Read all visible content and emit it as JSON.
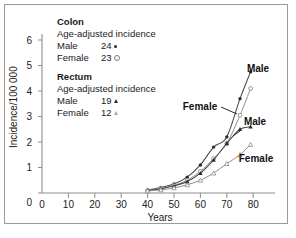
{
  "figure": {
    "border_color": "#9a9a9a",
    "background": "#ffffff"
  },
  "legend": {
    "colon": {
      "title": "Colon",
      "subtitle": "Age-adjusted incidence",
      "male_label": "Male",
      "male_value": "24",
      "male_marker": "filled-circle-icon",
      "female_label": "Female",
      "female_value": "23",
      "female_marker": "open-circle-icon"
    },
    "rectum": {
      "title": "Rectum",
      "subtitle": "Age-adjusted incidence",
      "male_label": "Male",
      "male_value": "19",
      "male_marker": "filled-triangle-icon",
      "female_label": "Female",
      "female_value": "12",
      "female_marker": "open-triangle-icon"
    }
  },
  "curve_labels": {
    "colon_male": "Male",
    "colon_female": "Female",
    "rectum_male": "Male",
    "rectum_female": "Female"
  },
  "chart_data": {
    "type": "line",
    "title": "",
    "xlabel": "Years",
    "ylabel": "Incidence/100 000",
    "xlim": [
      0,
      85
    ],
    "ylim": [
      0,
      6.6
    ],
    "xticks": [
      0,
      10,
      20,
      30,
      40,
      50,
      60,
      70,
      80
    ],
    "xticklabels": [
      "0",
      "10",
      "20",
      "30",
      "40",
      "50",
      "60",
      "70",
      "80"
    ],
    "yticks": [
      0,
      1,
      2,
      3,
      4,
      5,
      6
    ],
    "yticklabels": [
      "0",
      "1",
      "2",
      "3",
      "4",
      "5",
      "6"
    ],
    "grid": false,
    "legend_position": "upper-left-textblock",
    "x": [
      40,
      45,
      50,
      55,
      60,
      65,
      70,
      75,
      79
    ],
    "series": [
      {
        "name": "Colon Male",
        "marker": "filled-circle",
        "values": [
          0.12,
          0.22,
          0.35,
          0.62,
          1.1,
          1.8,
          2.2,
          3.7,
          4.75
        ]
      },
      {
        "name": "Colon Female",
        "marker": "open-circle",
        "values": [
          0.1,
          0.18,
          0.3,
          0.5,
          0.85,
          1.35,
          1.95,
          3.05,
          4.1
        ]
      },
      {
        "name": "Rectum Male",
        "marker": "filled-triangle",
        "values": [
          0.1,
          0.17,
          0.28,
          0.45,
          0.78,
          1.3,
          1.95,
          2.5,
          2.6
        ]
      },
      {
        "name": "Rectum Female",
        "marker": "open-triangle",
        "values": [
          0.08,
          0.12,
          0.2,
          0.32,
          0.5,
          0.78,
          1.15,
          1.5,
          1.9
        ]
      }
    ]
  }
}
